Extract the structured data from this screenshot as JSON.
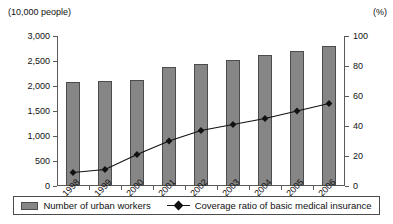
{
  "chart_data": {
    "type": "bar",
    "title": "",
    "subtitle": "",
    "xlabel": "",
    "ylabel": "(10,000 people)",
    "ylabel_right": "(%)",
    "categories": [
      "1998",
      "1999",
      "2000",
      "2001",
      "2002",
      "2003",
      "2004",
      "2005",
      "2006"
    ],
    "ylim": [
      0,
      3000
    ],
    "yticks": [
      "0",
      "500",
      "1,000",
      "1,500",
      "2,000",
      "2,500",
      "3,000"
    ],
    "ytick_values": [
      0,
      500,
      1000,
      1500,
      2000,
      2500,
      3000
    ],
    "ylim_right": [
      0,
      100
    ],
    "yticks_right": [
      "0",
      "20",
      "40",
      "60",
      "80",
      "100"
    ],
    "ytick_values_right": [
      0,
      20,
      40,
      60,
      80,
      100
    ],
    "grid": false,
    "legend_position": "bottom",
    "series": [
      {
        "name": "Number of urban workers",
        "type": "bar",
        "axis": "left",
        "unit": "10,000 people",
        "color": "#868686",
        "values": [
          2078,
          2100,
          2120,
          2390,
          2450,
          2520,
          2620,
          2700,
          2800
        ]
      },
      {
        "name": "Coverage ratio of basic medical insurance",
        "type": "line",
        "axis": "right",
        "unit": "%",
        "color": "#111111",
        "values": [
          9,
          11,
          21,
          30,
          37,
          41,
          45,
          50,
          55
        ]
      }
    ]
  },
  "legend": {
    "items": [
      {
        "label": "Number of urban workers",
        "marker": "bar-swatch-icon"
      },
      {
        "label": "Coverage ratio of basic medical insurance",
        "marker": "line-diamond-icon"
      }
    ]
  }
}
